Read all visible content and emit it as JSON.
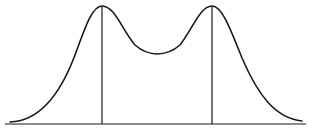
{
  "diagram": {
    "type": "bimodal-distribution-curve",
    "width": 312,
    "height": 129,
    "stroke_color": "#1a1a1a",
    "baseline": {
      "y": 124,
      "x_start": 5,
      "x_end": 306
    },
    "peaks": [
      {
        "x": 102,
        "y": 6
      },
      {
        "x": 212,
        "y": 6
      }
    ],
    "trough": {
      "x": 157,
      "y": 53
    },
    "curve_path": "M 10 122 C 40 121, 60 95, 75 55 C 85 28, 92 6, 102 6 C 115 6, 122 30, 135 45 C 143 52, 150 54, 157 54 C 165 54, 172 52, 180 45 C 192 30, 200 6, 212 6 C 222 6, 230 28, 242 58 C 258 95, 275 118, 302 121"
  }
}
